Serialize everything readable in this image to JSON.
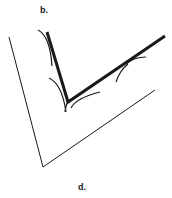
{
  "labels": {
    "top": "b.",
    "bottom": "d."
  },
  "colors": {
    "stroke": "#1a1a1a",
    "background": "#ffffff"
  },
  "shapes": {
    "outer_v": {
      "points": [
        [
          9,
          37
        ],
        [
          43,
          167
        ],
        [
          155,
          90
        ]
      ],
      "stroke_width": 1
    },
    "inner_v": {
      "points": [
        [
          47,
          32
        ],
        [
          68,
          102
        ],
        [
          165,
          36
        ]
      ],
      "stroke_width": 3
    }
  }
}
